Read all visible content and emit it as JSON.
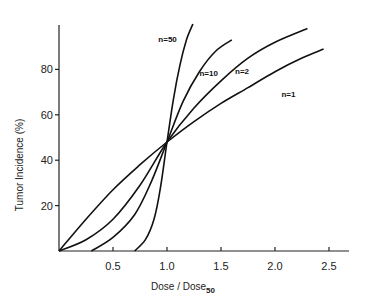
{
  "chart_data": {
    "type": "line",
    "title": "",
    "xlabel": "Dose / Dose",
    "xlabel_subscript": "50",
    "ylabel": "Tumor Incidence (%)",
    "xlim": [
      0,
      2.7
    ],
    "ylim": [
      0,
      100
    ],
    "grid": false,
    "legend": "inline curve labels",
    "x_ticks": [
      0.5,
      1.0,
      1.5,
      2.0,
      2.5
    ],
    "x_tick_labels": [
      "0.5",
      "1.0",
      "1.5",
      "2.0",
      "2.5"
    ],
    "y_ticks": [
      20,
      40,
      60,
      80
    ],
    "y_tick_labels": [
      "20",
      "40",
      "60",
      "80"
    ],
    "series": [
      {
        "name": "n=1",
        "label": "n=1",
        "x": [
          0,
          0.25,
          0.5,
          0.75,
          1.0,
          1.25,
          1.5,
          1.75,
          2.0,
          2.25,
          2.45
        ],
        "values": [
          0,
          14,
          27,
          38,
          48,
          57,
          65,
          72,
          79,
          85,
          89
        ],
        "label_pos": {
          "x": 2.06,
          "y": 68
        }
      },
      {
        "name": "n=2",
        "label": "n=2",
        "x": [
          0,
          0.25,
          0.5,
          0.75,
          1.0,
          1.25,
          1.5,
          1.75,
          2.0,
          2.3
        ],
        "values": [
          0,
          5,
          14,
          29,
          48,
          63,
          75,
          85,
          92,
          98
        ],
        "label_pos": {
          "x": 1.63,
          "y": 78
        }
      },
      {
        "name": "n=10",
        "label": "n=10",
        "x": [
          0.3,
          0.5,
          0.7,
          0.85,
          1.0,
          1.15,
          1.3,
          1.45,
          1.6
        ],
        "values": [
          0,
          6,
          16,
          30,
          48,
          66,
          79,
          88,
          93
        ],
        "label_pos": {
          "x": 1.3,
          "y": 77
        }
      },
      {
        "name": "n=50",
        "label": "n=50",
        "x": [
          0.7,
          0.8,
          0.88,
          0.94,
          1.0,
          1.06,
          1.12,
          1.18,
          1.24
        ],
        "values": [
          0,
          5,
          14,
          28,
          48,
          67,
          82,
          93,
          100
        ],
        "label_pos": {
          "x": 0.92,
          "y": 92
        }
      }
    ]
  }
}
